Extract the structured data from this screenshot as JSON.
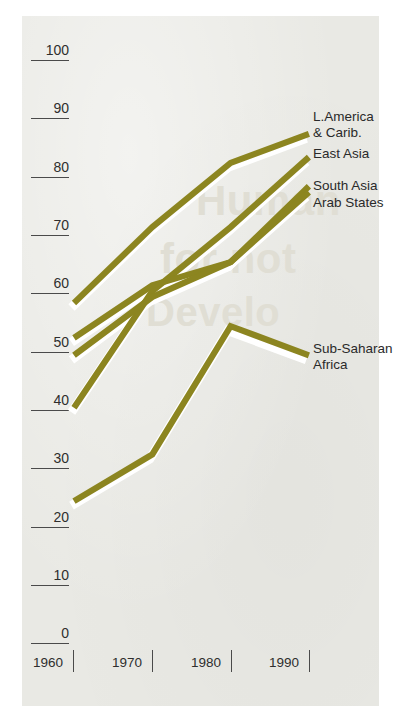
{
  "chart_data": {
    "type": "line",
    "title": "",
    "subtitle": "",
    "xlabel": "",
    "ylabel": "",
    "x": [
      1960,
      1970,
      1980,
      1990
    ],
    "xlim": [
      1960,
      1990
    ],
    "ylim": [
      0,
      100
    ],
    "xticks": [
      "1960",
      "1970",
      "1980",
      "1990"
    ],
    "yticks": [
      "0",
      "10",
      "20",
      "30",
      "40",
      "50",
      "60",
      "70",
      "80",
      "90",
      "100"
    ],
    "grid": false,
    "legend_position": "right-inline-labels",
    "line_color": "#8c8520",
    "series": [
      {
        "name": "L.America & Carib.",
        "label_lines": [
          "L.America",
          "& Carib."
        ],
        "values": [
          58,
          71,
          82,
          87
        ]
      },
      {
        "name": "East Asia",
        "label_lines": [
          "East Asia"
        ],
        "values": [
          40,
          60,
          71,
          83
        ]
      },
      {
        "name": "South Asia",
        "label_lines": [
          "South Asia"
        ],
        "values": [
          52,
          61,
          65,
          78
        ]
      },
      {
        "name": "Arab States",
        "label_lines": [
          "Arab States"
        ],
        "values": [
          49,
          59,
          65,
          77
        ]
      },
      {
        "name": "Sub-Saharan Africa",
        "label_lines": [
          "Sub-Saharan",
          "Africa"
        ],
        "values": [
          24,
          32,
          54,
          49
        ]
      }
    ]
  },
  "axis": {
    "y": [
      {
        "value": "100"
      },
      {
        "value": "90"
      },
      {
        "value": "80"
      },
      {
        "value": "70"
      },
      {
        "value": "60"
      },
      {
        "value": "50"
      },
      {
        "value": "40"
      },
      {
        "value": "30"
      },
      {
        "value": "20"
      },
      {
        "value": "10"
      },
      {
        "value": "0"
      }
    ],
    "x": [
      {
        "value": "1960"
      },
      {
        "value": "1970"
      },
      {
        "value": "1980"
      },
      {
        "value": "1990"
      }
    ]
  },
  "labels": {
    "lamerica_1": "L.America",
    "lamerica_2": "& Carib.",
    "east_asia": "East Asia",
    "south_asia": "South Asia",
    "arab_states": "Arab States",
    "subsaharan_1": "Sub-Saharan",
    "subsaharan_2": "Africa"
  },
  "ghost_text": {
    "l1": "Human",
    "l2": "for not",
    "l3": "Develo"
  },
  "colors": {
    "line": "#8c8520",
    "line_halo": "#ffffff",
    "panel": "#e9e9e4",
    "text": "#2e2e2e"
  }
}
